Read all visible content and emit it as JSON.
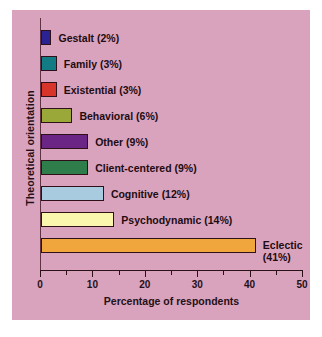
{
  "figure": {
    "background_color": "#ffffff",
    "panel_color": "#d9a3bd"
  },
  "chart_data": {
    "type": "bar",
    "orientation": "horizontal",
    "title": "",
    "xlabel": "Percentage of respondents",
    "ylabel": "Theoretical orientation",
    "xlim": [
      0,
      50
    ],
    "xticks": [
      0,
      10,
      20,
      30,
      40,
      50
    ],
    "xticklabels": [
      "0",
      "10",
      "20",
      "30",
      "40",
      "50"
    ],
    "minor_ticks": [
      5,
      15,
      25,
      35,
      45
    ],
    "grid": false,
    "legend": "none",
    "categories": [
      "Gestalt",
      "Family",
      "Existential",
      "Behavioral",
      "Other",
      "Client-centered",
      "Cognitive",
      "Psychodynamic",
      "Eclectic"
    ],
    "values": [
      2,
      3,
      3,
      6,
      9,
      9,
      12,
      14,
      41
    ],
    "bars": [
      {
        "category": "Gestalt",
        "value": 2,
        "label": "Gestalt (2%)",
        "label_line2": "",
        "color": "#2b2391"
      },
      {
        "category": "Family",
        "value": 3,
        "label": "Family (3%)",
        "label_line2": "",
        "color": "#137b84"
      },
      {
        "category": "Existential",
        "value": 3,
        "label": "Existential (3%)",
        "label_line2": "",
        "color": "#d8352a"
      },
      {
        "category": "Behavioral",
        "value": 6,
        "label": "Behavioral (6%)",
        "label_line2": "",
        "color": "#9aa83a"
      },
      {
        "category": "Other",
        "value": 9,
        "label": "Other (9%)",
        "label_line2": "",
        "color": "#6b2585"
      },
      {
        "category": "Client-centered",
        "value": 9,
        "label": "Client-centered (9%)",
        "label_line2": "",
        "color": "#2e7d4a"
      },
      {
        "category": "Cognitive",
        "value": 12,
        "label": "Cognitive (12%)",
        "label_line2": "",
        "color": "#a8cbe0"
      },
      {
        "category": "Psychodynamic",
        "value": 14,
        "label": "Psychodynamic (14%)",
        "label_line2": "",
        "color": "#fbf6ae"
      },
      {
        "category": "Eclectic",
        "value": 41,
        "label": "Eclectic",
        "label_line2": "(41%)",
        "color": "#f0a63c"
      }
    ]
  }
}
